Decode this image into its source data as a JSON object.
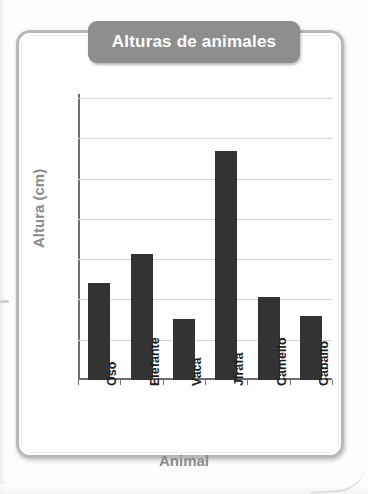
{
  "chart_data": {
    "type": "bar",
    "title": "Alturas de animales",
    "xlabel": "Animal",
    "ylabel": "Altura (cm)",
    "categories": [
      "Oso",
      "Elefante",
      "Vaca",
      "Jirafa",
      "Camello",
      "Caballo"
    ],
    "values": [
      240,
      313,
      152,
      568,
      207,
      158
    ],
    "ylim": [
      0,
      700
    ],
    "ytick_labels": [
      "700",
      "600",
      "500",
      "400",
      "300",
      "200",
      "100",
      "0"
    ],
    "ytick_values": [
      700,
      600,
      500,
      400,
      300,
      200,
      100,
      0
    ],
    "ytick_step": 100,
    "grid": true,
    "grid_axis": "y",
    "legend": false,
    "bar_color": "#333333",
    "title_banner_color": "#8e8e8e",
    "title_text_color": "#ffffff",
    "axis_title_color": "#8a8a8a",
    "grid_color": "#d6d6d6",
    "axis_color": "#6e6e6e",
    "frame_color": "#b9b9b9",
    "background_color": "#ffffff"
  }
}
